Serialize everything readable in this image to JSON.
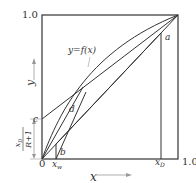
{
  "diagram": {
    "type": "McCabe-Thiele distillation diagram",
    "axes": {
      "x_label": "x",
      "y_label": "y",
      "x_tick_origin": "0",
      "x_tick_max": "1.0",
      "y_tick_max": "1.0"
    },
    "curve_label": "y=f(x)",
    "points": {
      "a": "a",
      "b": "b",
      "c": "c",
      "d": "d"
    },
    "x_marks": {
      "xw": "x",
      "xw_sub": "w",
      "xd": "x",
      "xd_sub": "D"
    },
    "intercept_label": {
      "numerator": "x",
      "numerator_sub": "D",
      "denominator": "R+1"
    },
    "colors": {
      "line": "#333333",
      "arrow": "#999999"
    }
  }
}
